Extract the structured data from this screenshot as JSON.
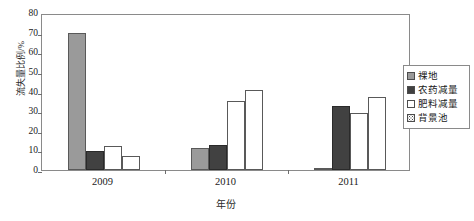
{
  "chart_data": {
    "type": "bar",
    "title": "",
    "xlabel": "年份",
    "ylabel": "流失量比例/%",
    "categories": [
      "2009",
      "2010",
      "2011"
    ],
    "series": [
      {
        "name": "裸地",
        "swatch": "solid-gray",
        "color": "#9a9a9a",
        "values": [
          70.0,
          11.0,
          0.5
        ]
      },
      {
        "name": "农药减量",
        "swatch": "solid-dark",
        "color": "#414141",
        "values": [
          9.5,
          12.5,
          32.5
        ]
      },
      {
        "name": "肥料减量",
        "swatch": "open-white",
        "color": "#ffffff",
        "values": [
          12.0,
          35.0,
          29.0
        ]
      },
      {
        "name": "背景池",
        "swatch": "dotted-fill",
        "color": "#ffffff",
        "values": [
          7.0,
          41.0,
          37.0
        ]
      }
    ],
    "ylim": [
      0,
      80
    ],
    "yticks": [
      0,
      10,
      20,
      30,
      40,
      50,
      60,
      70,
      80
    ],
    "ytick_labels": [
      "0",
      "10",
      "20",
      "30",
      "40",
      "50",
      "60",
      "70",
      "80"
    ],
    "grid": false,
    "legend_position": "right",
    "axis_color": "#8a8a8a"
  },
  "legend": {
    "items": [
      {
        "label": "裸地"
      },
      {
        "label": "农药减量"
      },
      {
        "label": "肥料减量"
      },
      {
        "label": "背景池"
      }
    ]
  }
}
